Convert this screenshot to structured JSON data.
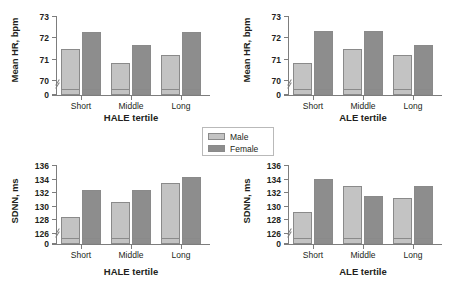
{
  "legend": {
    "items": [
      {
        "label": "Male",
        "color": "#c3c3c3"
      },
      {
        "label": "Female",
        "color": "#8d8d8d"
      }
    ]
  },
  "colors": {
    "male": "#c3c3c3",
    "female": "#8d8d8d",
    "axis": "#7d7d7d",
    "bar_outline": "#8a8a8a",
    "text": "#231f20",
    "background": "#ffffff"
  },
  "chart_data": [
    {
      "id": "hr-hale",
      "type": "bar",
      "position": "top-left",
      "title": "",
      "xlabel": "HALE tertile",
      "ylabel": "Mean HR, bpm",
      "categories": [
        "Short",
        "Middle",
        "Long"
      ],
      "ylim": [
        69.6,
        73
      ],
      "yticks": [
        0,
        70,
        71,
        72,
        73
      ],
      "ytick_labels": [
        "0",
        "70",
        "71",
        "72",
        "73"
      ],
      "axis_break": true,
      "grid": false,
      "legend_position": "center-figure",
      "series": [
        {
          "name": "Male",
          "values": [
            71.5,
            70.85,
            71.25
          ]
        },
        {
          "name": "Female",
          "values": [
            72.3,
            71.7,
            72.3
          ]
        }
      ]
    },
    {
      "id": "hr-ale",
      "type": "bar",
      "position": "top-right",
      "title": "",
      "xlabel": "ALE tertile",
      "ylabel": "Mean HR, bpm",
      "categories": [
        "Short",
        "Middle",
        "Long"
      ],
      "ylim": [
        69.6,
        73
      ],
      "yticks": [
        0,
        70,
        71,
        72,
        73
      ],
      "ytick_labels": [
        "0",
        "70",
        "71",
        "72",
        "73"
      ],
      "axis_break": true,
      "grid": false,
      "legend_position": "center-figure",
      "series": [
        {
          "name": "Male",
          "values": [
            70.85,
            71.5,
            71.25
          ]
        },
        {
          "name": "Female",
          "values": [
            72.35,
            72.35,
            71.7
          ]
        }
      ]
    },
    {
      "id": "sdnn-hale",
      "type": "bar",
      "position": "bottom-left",
      "title": "",
      "xlabel": "HALE tertile",
      "ylabel": "SDNN, ms",
      "categories": [
        "Short",
        "Middle",
        "Long"
      ],
      "ylim": [
        125.2,
        136
      ],
      "yticks": [
        0,
        126,
        128,
        130,
        132,
        134,
        136
      ],
      "ytick_labels": [
        "0",
        "126",
        "128",
        "130",
        "132",
        "134",
        "136"
      ],
      "axis_break": true,
      "grid": false,
      "legend_position": "center-figure",
      "series": [
        {
          "name": "Male",
          "values": [
            128.4,
            130.7,
            133.5
          ]
        },
        {
          "name": "Female",
          "values": [
            132.4,
            132.5,
            134.4
          ]
        }
      ]
    },
    {
      "id": "sdnn-ale",
      "type": "bar",
      "position": "bottom-right",
      "title": "",
      "xlabel": "ALE tertile",
      "ylabel": "SDNN, ms",
      "categories": [
        "Short",
        "Middle",
        "Long"
      ],
      "ylim": [
        125.2,
        136
      ],
      "yticks": [
        0,
        126,
        128,
        130,
        132,
        134,
        136
      ],
      "ytick_labels": [
        "0",
        "126",
        "128",
        "130",
        "132",
        "134",
        "136"
      ],
      "axis_break": true,
      "grid": false,
      "legend_position": "center-figure",
      "series": [
        {
          "name": "Male",
          "values": [
            129.2,
            133.0,
            131.2
          ]
        },
        {
          "name": "Female",
          "values": [
            134.1,
            131.6,
            133.1
          ]
        }
      ]
    }
  ]
}
